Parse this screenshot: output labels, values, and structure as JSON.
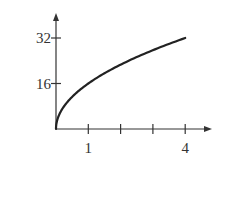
{
  "chart_data": {
    "type": "line",
    "title": "",
    "xlabel": "",
    "ylabel": "",
    "function": "y = 16*sqrt(x)",
    "x": [
      0,
      0.25,
      0.5,
      1,
      1.5,
      2,
      2.5,
      3,
      3.5,
      4
    ],
    "series": [
      {
        "name": "curve",
        "values": [
          0,
          8,
          11.31,
          16,
          19.6,
          22.63,
          25.3,
          27.71,
          29.93,
          32
        ]
      }
    ],
    "xlim": [
      0,
      4.8
    ],
    "ylim": [
      0,
      36
    ],
    "x_ticks": [
      1,
      2,
      3,
      4
    ],
    "x_tick_labels": [
      "1",
      "",
      "",
      "4"
    ],
    "y_ticks": [
      16,
      32
    ],
    "y_tick_labels": [
      "16",
      "32"
    ],
    "grid": false,
    "legend": null
  },
  "colors": {
    "axis": "#333333",
    "curve": "#222222",
    "background": "#ffffff"
  }
}
